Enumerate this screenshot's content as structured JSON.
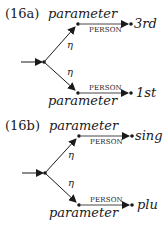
{
  "diagrams": [
    {
      "id": "16a",
      "label": "(16a)",
      "top_node_label": "parameter",
      "bottom_node_label": "parameter",
      "branch_labels": [
        "η",
        "η"
      ],
      "edge_label_top": "PERSON",
      "edge_label_bottom": "PERSON",
      "top_value": "3rd",
      "bottom_value": "1st"
    },
    {
      "id": "16b",
      "label": "(16b)",
      "top_node_label": "parameter",
      "bottom_node_label": "parameter",
      "branch_labels": [
        "η",
        "η"
      ],
      "edge_label_top": "PERSON",
      "edge_label_bottom": "PERSON",
      "top_value": "sing",
      "bottom_value": "plu"
    }
  ],
  "colors": {
    "ink": "#1a1a1a",
    "background": "#ffffff"
  }
}
